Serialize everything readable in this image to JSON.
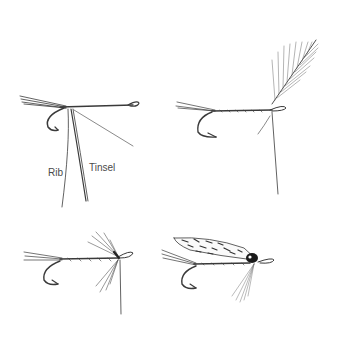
{
  "figure": {
    "panels": [
      {
        "id": "step1",
        "description": "Hook with tail, rib and tinsel tied in",
        "labels": {
          "rib": "Rib",
          "tinsel": "Tinsel"
        }
      },
      {
        "id": "step2",
        "description": "Body wound with tinsel and rib, hackle feather tied in"
      },
      {
        "id": "step3",
        "description": "Hackle wound at head"
      },
      {
        "id": "step4",
        "description": "Finished fly with mottled wing and dark head"
      }
    ],
    "colors": {
      "ink": "#3a3a3a",
      "background": "#ffffff",
      "head": "#1a1a1a"
    }
  }
}
